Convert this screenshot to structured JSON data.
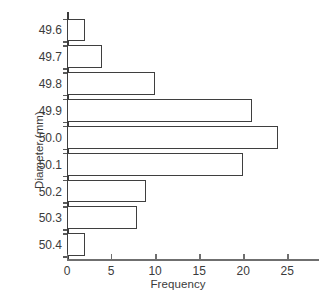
{
  "chart_data": {
    "type": "bar",
    "orientation": "horizontal",
    "title": "",
    "xlabel": "Frequency",
    "ylabel": "Diameter (mm)",
    "categories": [
      "49.6",
      "49.7",
      "49.8",
      "49.9",
      "50.0",
      "50.1",
      "50.2",
      "50.3",
      "50.4"
    ],
    "values": [
      2,
      4,
      10,
      21,
      24,
      20,
      9,
      8,
      2
    ],
    "xlim": [
      0,
      28.6
    ],
    "xticks": [
      0,
      5,
      10,
      15,
      20,
      25
    ],
    "xtick_labels": [
      "0",
      "5",
      "10",
      "15",
      "20",
      "25"
    ],
    "grid": false,
    "legend": null,
    "bar_fill_color": "#ffffff",
    "bar_edge_color": "#3f3f3f",
    "axis_color": "#3b3b3b",
    "text_color": "#3b3b3b",
    "background_color": "#ffffff"
  }
}
